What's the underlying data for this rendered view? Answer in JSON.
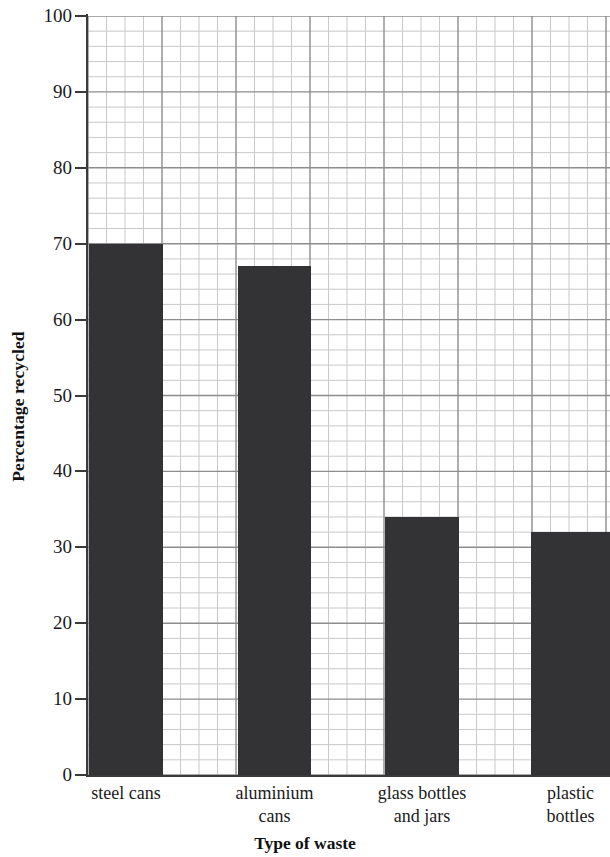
{
  "chart_data": {
    "type": "bar",
    "title": "",
    "xlabel": "Type of waste",
    "ylabel": "Percentage recycled",
    "categories": [
      "steel cans",
      "aluminium cans",
      "glass bottles and jars",
      "plastic bottles"
    ],
    "category_lines": [
      [
        "steel cans"
      ],
      [
        "aluminium",
        "cans"
      ],
      [
        "glass bottles",
        "and jars"
      ],
      [
        "plastic",
        "bottles"
      ]
    ],
    "values": [
      70,
      67,
      34,
      32
    ],
    "ylim": [
      0,
      100
    ],
    "ytick_step": 10,
    "yticks": [
      100,
      90,
      80,
      70,
      60,
      50,
      40,
      30,
      20,
      10,
      0
    ],
    "ytick_labels": [
      "100",
      "90",
      "80",
      "70",
      "60",
      "50",
      "40",
      "30",
      "20",
      "10",
      "0"
    ],
    "grid": true,
    "minor_grid": true,
    "minor_grid_step_y": 2,
    "legend": "none",
    "bar_color": "#333234",
    "grid_major_color": "#8d8d8d",
    "grid_minor_color": "#c9c9c9",
    "axis_color": "#3a3a3a",
    "background": "#ffffff"
  },
  "axes": {
    "y_axis_title": "Percentage recycled",
    "x_axis_title": "Type of waste"
  }
}
